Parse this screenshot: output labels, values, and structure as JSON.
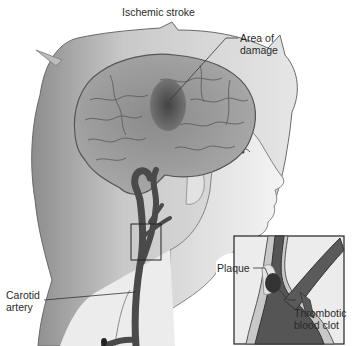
{
  "figure": {
    "title": "Ischemic stroke",
    "labels": {
      "area_of_damage_line1": "Area of",
      "area_of_damage_line2": "damage",
      "carotid_line1": "Carotid",
      "carotid_line2": "artery",
      "plaque": "Plaque",
      "clot_line1": "Thrombotic",
      "clot_line2": "blood clot"
    },
    "style": {
      "palette": "grayscale",
      "background": "#ffffff"
    }
  }
}
